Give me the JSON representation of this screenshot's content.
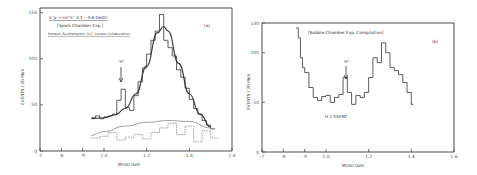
{
  "chart_data": [
    {
      "panel": "(a)",
      "type": "line",
      "title_lines": [
        "π⁻p → nπ⁺π⁻   3.1 – 3.6 GeV/c",
        "[Spark Chamber Exp.]",
        "Harwell, Southampton, U.C. London Collaboration"
      ],
      "xlabel": "M(ππ) GeV",
      "ylabel": "EVENTS / 20 MeV",
      "xlim": [
        0.7,
        1.6
      ],
      "ylim": [
        0,
        155
      ],
      "xticks": [
        "·7",
        "·8",
        "·9",
        "1.0",
        "1.2",
        "1.4",
        "1.6"
      ],
      "xtick_values": [
        0.7,
        0.8,
        0.9,
        1.0,
        1.2,
        1.4,
        1.6
      ],
      "yticks": [
        "0",
        "50",
        "100",
        "150"
      ],
      "ytick_values": [
        0,
        50,
        100,
        150
      ],
      "annotation": "S*",
      "annotation_x": 1.07,
      "series": [
        {
          "name": "histogram",
          "style": "step",
          "x": [
            0.94,
            0.96,
            0.98,
            1.0,
            1.02,
            1.04,
            1.06,
            1.08,
            1.1,
            1.12,
            1.14,
            1.16,
            1.18,
            1.2,
            1.22,
            1.24,
            1.26,
            1.28,
            1.3,
            1.32,
            1.34,
            1.36,
            1.38,
            1.4,
            1.42,
            1.44,
            1.46,
            1.48,
            1.5
          ],
          "values": [
            36,
            38,
            35,
            37,
            38,
            40,
            55,
            67,
            47,
            44,
            60,
            75,
            90,
            105,
            120,
            130,
            148,
            120,
            112,
            103,
            88,
            80,
            68,
            56,
            46,
            40,
            33,
            28,
            24
          ]
        },
        {
          "name": "fit (resonance + background)",
          "style": "smooth",
          "x": [
            0.94,
            1.0,
            1.05,
            1.1,
            1.15,
            1.2,
            1.25,
            1.28,
            1.3,
            1.35,
            1.4,
            1.45,
            1.5
          ],
          "values": [
            35,
            36,
            39,
            46,
            62,
            92,
            128,
            135,
            130,
            95,
            62,
            40,
            26
          ]
        },
        {
          "name": "background curve",
          "style": "smooth",
          "x": [
            0.94,
            1.0,
            1.1,
            1.2,
            1.3,
            1.4,
            1.5
          ],
          "values": [
            17,
            21,
            27,
            31,
            33,
            32,
            25
          ]
        },
        {
          "name": "background histogram",
          "style": "step-dashed",
          "x": [
            0.94,
            0.98,
            1.02,
            1.06,
            1.1,
            1.14,
            1.18,
            1.22,
            1.26,
            1.3,
            1.34,
            1.38,
            1.42,
            1.46,
            1.5
          ],
          "values": [
            14,
            16,
            20,
            12,
            15,
            18,
            13,
            20,
            25,
            30,
            18,
            27,
            10,
            22,
            14
          ]
        }
      ]
    },
    {
      "panel": "(b)",
      "type": "line",
      "title_lines": [
        "[Bubble Chamber Exp. Compilation]"
      ],
      "xlabel": "M(ππ) GeV",
      "ylabel": "EVENTS / 20 MeV",
      "xlim": [
        0.7,
        1.6
      ],
      "ylim": [
        0,
        130
      ],
      "xticks": [
        "·7",
        "·8",
        "·9",
        "1.0",
        "1.2",
        "1.4",
        "1.6"
      ],
      "xtick_values": [
        0.7,
        0.8,
        0.9,
        1.0,
        1.2,
        1.4,
        1.6
      ],
      "yticks": [
        "0",
        "50",
        "100",
        "130"
      ],
      "ytick_values": [
        0,
        50,
        100,
        130
      ],
      "annotation": "S*",
      "annotation_x": 1.08,
      "legend_note": "H 1 EVENT",
      "series": [
        {
          "name": "histogram",
          "style": "step",
          "x": [
            0.86,
            0.87,
            0.88,
            0.89,
            0.9,
            0.92,
            0.94,
            0.96,
            0.98,
            1.0,
            1.02,
            1.04,
            1.06,
            1.08,
            1.1,
            1.12,
            1.14,
            1.16,
            1.18,
            1.2,
            1.22,
            1.24,
            1.26,
            1.28,
            1.3,
            1.32,
            1.34,
            1.36,
            1.38,
            1.4
          ],
          "values": [
            125,
            115,
            95,
            85,
            80,
            65,
            55,
            52,
            56,
            57,
            50,
            55,
            58,
            75,
            60,
            48,
            57,
            55,
            60,
            75,
            95,
            90,
            110,
            100,
            85,
            82,
            78,
            70,
            60,
            48
          ]
        }
      ]
    }
  ],
  "panel_a": {
    "label": "(a)",
    "title1": "π⁻p → nπ⁺π⁻   3.1 – 3.6 GeV/c",
    "title2": "[Spark Chamber Exp.]",
    "title3": "Harwell, Southampton, U.C. London Collaboration",
    "annotation": "S*",
    "xlabel": "M(ππ) GeV",
    "ylabel": "EVENTS / 20 MeV",
    "yticks": [
      "0",
      "50",
      "100",
      "150"
    ],
    "xticks": [
      "·7",
      "·8",
      "·9",
      "1.0",
      "1.2",
      "1.4",
      "1.6"
    ]
  },
  "panel_b": {
    "label": "(b)",
    "title1": "[Bubble Chamber Exp. Compilation]",
    "annotation": "S*",
    "note": "H 1 EVENT",
    "xlabel": "M(ππ) GeV",
    "ylabel": "EVENTS / 20 MeV",
    "yticks": [
      "0",
      "50",
      "100",
      "130"
    ],
    "xticks": [
      "·7",
      "·8",
      "·9",
      "1.0",
      "1.2",
      "1.4",
      "1.6"
    ]
  }
}
